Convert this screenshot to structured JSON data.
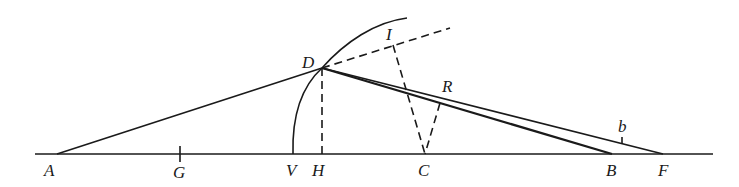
{
  "diagram": {
    "type": "geometric-construction",
    "points": {
      "A": {
        "label": "A",
        "x": 57,
        "y": 154
      },
      "G": {
        "label": "G",
        "x": 180,
        "y": 154
      },
      "V": {
        "label": "V",
        "x": 293,
        "y": 154
      },
      "H": {
        "label": "H",
        "x": 322,
        "y": 154
      },
      "C": {
        "label": "C",
        "x": 425,
        "y": 154
      },
      "B": {
        "label": "B",
        "x": 612,
        "y": 154
      },
      "F": {
        "label": "F",
        "x": 663,
        "y": 154
      },
      "D": {
        "label": "D",
        "x": 322,
        "y": 68
      },
      "I": {
        "label": "I",
        "x": 393,
        "y": 45
      },
      "R": {
        "label": "R",
        "x": 440,
        "y": 103
      },
      "b": {
        "label": "b",
        "x": 622,
        "y": 140
      }
    },
    "labels": [
      "A",
      "G",
      "V",
      "H",
      "C",
      "B",
      "F",
      "D",
      "I",
      "R",
      "b"
    ],
    "segments": [
      {
        "from": "A",
        "to": "D",
        "style": "solid"
      },
      {
        "from": "D",
        "to": "B",
        "style": "solid-thick"
      },
      {
        "from": "D",
        "to": "F",
        "style": "solid"
      },
      {
        "from": "D",
        "to": "H",
        "style": "dashed"
      },
      {
        "from": "D",
        "to": "I-extended",
        "style": "dashed"
      },
      {
        "from": "I",
        "to": "C",
        "style": "dashed"
      },
      {
        "from": "R",
        "to": "C",
        "style": "dashed"
      }
    ],
    "arcs": [
      {
        "from": "V",
        "through": "D",
        "style": "solid"
      }
    ],
    "baseline": {
      "from_x": 35,
      "to_x": 713,
      "y": 154
    }
  }
}
